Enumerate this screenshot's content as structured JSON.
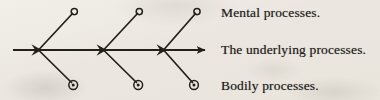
{
  "figure": {
    "type": "diagram",
    "style": "fishbone-branching-arrow",
    "background_color": "#ebe7e0",
    "ink_color": "#23201c",
    "main_axis": {
      "name": "The underlying processes.",
      "direction": "left-to-right",
      "has_arrowhead": true,
      "start_x": 13,
      "end_x": 207,
      "y": 50
    },
    "nodes": [
      {
        "id": "node-1",
        "x": 38,
        "y": 50,
        "marker": "filled-vertex"
      },
      {
        "id": "node-2",
        "x": 103,
        "y": 50,
        "marker": "filled-vertex"
      },
      {
        "id": "node-3",
        "x": 163,
        "y": 50,
        "marker": "filled-vertex"
      }
    ],
    "upper_branches": [
      {
        "id": "upper-branch-1",
        "from_x": 38,
        "from_y": 50,
        "to_x": 74,
        "to_y": 12,
        "endpoint_marker": "open-circle"
      },
      {
        "id": "upper-branch-2",
        "from_x": 103,
        "from_y": 50,
        "to_x": 139,
        "to_y": 12,
        "endpoint_marker": "open-circle"
      },
      {
        "id": "upper-branch-3",
        "from_x": 163,
        "from_y": 50,
        "to_x": 197,
        "to_y": 12,
        "endpoint_marker": "open-circle"
      }
    ],
    "lower_branches": [
      {
        "id": "lower-branch-1",
        "from_x": 38,
        "from_y": 50,
        "to_x": 73,
        "to_y": 85,
        "endpoint_marker": "circled-dot"
      },
      {
        "id": "lower-branch-2",
        "from_x": 103,
        "from_y": 50,
        "to_x": 138,
        "to_y": 85,
        "endpoint_marker": "circled-dot"
      },
      {
        "id": "lower-branch-3",
        "from_x": 163,
        "from_y": 50,
        "to_x": 194,
        "to_y": 85,
        "endpoint_marker": "circled-dot"
      }
    ],
    "labels": {
      "mental": "Mental processes.",
      "underlying": "The underlying processes.",
      "bodily": "Bodily processes."
    }
  }
}
